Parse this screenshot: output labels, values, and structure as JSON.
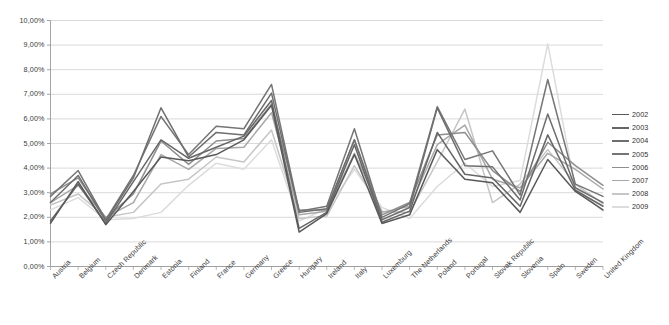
{
  "chart_data": {
    "type": "line",
    "title": "",
    "xlabel": "",
    "ylabel": "",
    "ylim": [
      0,
      10
    ],
    "ytick_values": [
      0,
      1,
      2,
      3,
      4,
      5,
      6,
      7,
      8,
      9,
      10
    ],
    "ytick_labels": [
      "0,00%",
      "1,00%",
      "2,00%",
      "3,00%",
      "4,00%",
      "5,00%",
      "6,00%",
      "7,00%",
      "8,00%",
      "9,00%",
      "10,00%"
    ],
    "grid": true,
    "legend_position": "right",
    "categories": [
      "Austria",
      "Belgium",
      "Czech Republic",
      "Denmark",
      "Estonia",
      "Finland",
      "France",
      "Germany",
      "Greece",
      "Hungary",
      "Ireland",
      "Italy",
      "Luxemburg",
      "The Netherlands",
      "Poland",
      "Portugal",
      "Slovak Republic",
      "Slovenia",
      "Spain",
      "Sweden",
      "United Kingdom"
    ],
    "series": [
      {
        "name": "2002",
        "color": "#595959",
        "values": [
          1.75,
          3.45,
          1.7,
          3.05,
          4.45,
          4.3,
          4.55,
          5.15,
          6.55,
          1.4,
          2.15,
          4.55,
          1.75,
          2.1,
          4.75,
          3.55,
          3.4,
          2.2,
          4.35,
          3.05,
          2.3
        ]
      },
      {
        "name": "2003",
        "color": "#666666",
        "values": [
          1.85,
          3.35,
          1.75,
          3.45,
          5.15,
          4.4,
          4.85,
          5.3,
          6.75,
          1.55,
          2.2,
          4.95,
          1.8,
          2.25,
          5.45,
          3.75,
          3.6,
          2.45,
          5.35,
          3.1,
          2.45
        ]
      },
      {
        "name": "2004",
        "color": "#6e6e6e",
        "values": [
          2.6,
          3.7,
          1.85,
          3.6,
          6.45,
          4.45,
          5.45,
          5.35,
          7.05,
          2.2,
          2.35,
          5.15,
          1.9,
          2.4,
          6.45,
          4.1,
          4.05,
          2.7,
          6.2,
          3.2,
          2.6
        ]
      },
      {
        "name": "2005",
        "color": "#757575",
        "values": [
          2.85,
          3.9,
          1.9,
          3.7,
          6.1,
          4.55,
          5.7,
          5.6,
          7.4,
          2.25,
          2.45,
          5.6,
          2.0,
          2.55,
          6.5,
          4.35,
          4.7,
          2.9,
          7.6,
          3.35,
          2.85
        ]
      },
      {
        "name": "2006",
        "color": "#8e8e8e",
        "values": [
          2.95,
          3.6,
          1.95,
          2.95,
          5.1,
          4.15,
          5.1,
          5.2,
          6.6,
          2.3,
          2.3,
          5.15,
          2.1,
          2.6,
          5.35,
          5.45,
          3.9,
          3.05,
          5.05,
          4.1,
          3.3
        ]
      },
      {
        "name": "2007",
        "color": "#a8a8a8",
        "values": [
          2.6,
          3.3,
          2.0,
          2.6,
          4.55,
          3.95,
          4.8,
          4.85,
          6.25,
          2.1,
          2.25,
          4.6,
          2.2,
          2.45,
          4.95,
          5.75,
          3.55,
          3.2,
          4.6,
          3.95,
          3.15
        ]
      },
      {
        "name": "2008",
        "color": "#c6c6c6",
        "values": [
          2.5,
          2.95,
          2.0,
          2.2,
          3.35,
          3.55,
          4.45,
          4.25,
          5.55,
          1.95,
          2.05,
          4.1,
          2.25,
          2.2,
          4.25,
          6.4,
          2.6,
          3.35,
          4.75,
          3.35,
          2.55
        ]
      },
      {
        "name": "2009",
        "color": "#dcdcdc",
        "values": [
          2.3,
          2.8,
          1.9,
          1.95,
          2.2,
          3.3,
          4.2,
          3.95,
          5.15,
          1.85,
          2.35,
          3.95,
          2.4,
          1.95,
          3.25,
          4.2,
          3.25,
          3.5,
          9.05,
          3.2,
          2.25
        ]
      }
    ]
  },
  "legend": {
    "entries": [
      {
        "label": "2002"
      },
      {
        "label": "2003"
      },
      {
        "label": "2004"
      },
      {
        "label": "2005"
      },
      {
        "label": "2006"
      },
      {
        "label": "2007"
      },
      {
        "label": "2008"
      },
      {
        "label": "2009"
      }
    ]
  },
  "colors": {
    "grid": "#cfcfcf",
    "axis": "#9a9a9a",
    "text": "#3a3a3a",
    "background": "#ffffff"
  }
}
